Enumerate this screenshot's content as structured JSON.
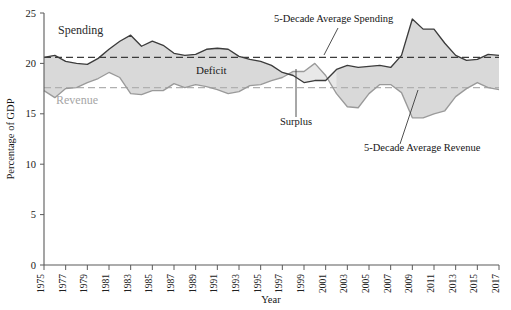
{
  "chart_data": {
    "type": "area",
    "title": "",
    "subtitle": "",
    "xlabel": "Year",
    "ylabel": "Percentage of GDP",
    "xlim": [
      1975,
      2017
    ],
    "ylim": [
      0,
      25
    ],
    "yticks": [
      0,
      5,
      10,
      15,
      20,
      25
    ],
    "xticks": [
      1975,
      1977,
      1979,
      1981,
      1983,
      1985,
      1987,
      1989,
      1991,
      1993,
      1995,
      1997,
      1999,
      2001,
      2003,
      2005,
      2007,
      2009,
      2011,
      2013,
      2015,
      2017
    ],
    "grid": false,
    "legend_position": "inline-annotations",
    "x": [
      1975,
      1976,
      1977,
      1978,
      1979,
      1980,
      1981,
      1982,
      1983,
      1984,
      1985,
      1986,
      1987,
      1988,
      1989,
      1990,
      1991,
      1992,
      1993,
      1994,
      1995,
      1996,
      1997,
      1998,
      1999,
      2000,
      2001,
      2002,
      2003,
      2004,
      2005,
      2006,
      2007,
      2008,
      2009,
      2010,
      2011,
      2012,
      2013,
      2014,
      2015,
      2016,
      2017
    ],
    "series": [
      {
        "name": "Spending",
        "color": "#3c3c3c",
        "values": [
          20.6,
          20.8,
          20.2,
          20.0,
          19.9,
          20.5,
          21.4,
          22.2,
          22.8,
          21.7,
          22.2,
          21.8,
          21.0,
          20.8,
          20.9,
          21.4,
          21.5,
          21.4,
          20.7,
          20.4,
          20.2,
          19.8,
          19.1,
          18.8,
          18.1,
          18.3,
          18.3,
          19.4,
          19.8,
          19.6,
          19.7,
          19.8,
          19.6,
          20.8,
          24.4,
          23.4,
          23.4,
          22.0,
          20.8,
          20.3,
          20.4,
          20.9,
          20.8
        ]
      },
      {
        "name": "Revenue",
        "color": "#9a9a9a",
        "values": [
          17.3,
          16.6,
          17.5,
          17.6,
          18.1,
          18.5,
          19.1,
          18.6,
          17.0,
          16.9,
          17.3,
          17.3,
          18.0,
          17.6,
          17.9,
          17.7,
          17.4,
          17.0,
          17.2,
          17.8,
          17.9,
          18.3,
          18.6,
          19.2,
          19.2,
          20.0,
          18.8,
          17.0,
          15.7,
          15.6,
          17.0,
          17.9,
          17.9,
          17.1,
          14.6,
          14.6,
          15.0,
          15.3,
          16.7,
          17.5,
          18.1,
          17.6,
          17.4
        ]
      }
    ],
    "reference_lines": [
      {
        "name": "5-Decade Average Spending",
        "value": 20.6,
        "color": "#3c3c3c",
        "style": "dashed"
      },
      {
        "name": "5-Decade Average Revenue",
        "value": 17.6,
        "color": "#a8a8a8",
        "style": "dashed"
      }
    ],
    "annotations": [
      {
        "text": "Spending",
        "x": 1978.5,
        "y": 23.2
      },
      {
        "text": "Revenue",
        "x": 1978.0,
        "y": 16.2
      },
      {
        "text": "Deficit",
        "x": 1990.5,
        "y": 19.2
      },
      {
        "text": "Surplus",
        "x": 1999.5,
        "y": 15.6
      },
      {
        "text": "5-Decade Average Spending",
        "x": 2002.0,
        "y": 24.4
      },
      {
        "text": "5-Decade Average Revenue",
        "x": 2010.5,
        "y": 13.2
      }
    ]
  },
  "axes": {
    "ylabel": "Percentage of GDP",
    "xlabel": "Year"
  },
  "labels": {
    "spending": "Spending",
    "revenue": "Revenue",
    "deficit": "Deficit",
    "surplus": "Surplus",
    "avg_spending": "5-Decade Average Spending",
    "avg_revenue": "5-Decade Average Revenue"
  },
  "colors": {
    "spending_line": "#3c3c3c",
    "revenue_line": "#9a9a9a",
    "fill": "#d9d9d9",
    "surplus_fill": "#e6e6e6",
    "axis": "#5a5a5a",
    "text": "#1a1a1a"
  }
}
